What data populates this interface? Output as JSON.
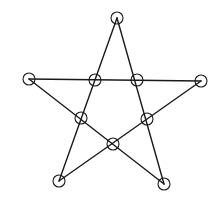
{
  "diagram": {
    "type": "pentagram-graph",
    "colors": {
      "stroke": "#1a1a1a",
      "background": "#ffffff"
    },
    "node_radius": 6,
    "nodes": [
      {
        "id": "outer-top",
        "x": 117,
        "y": 18
      },
      {
        "id": "outer-left",
        "x": 29,
        "y": 79
      },
      {
        "id": "outer-right",
        "x": 201,
        "y": 81
      },
      {
        "id": "outer-bottom-left",
        "x": 59,
        "y": 181
      },
      {
        "id": "outer-bottom-right",
        "x": 164,
        "y": 184
      },
      {
        "id": "inner-top-left",
        "x": 95,
        "y": 80
      },
      {
        "id": "inner-top-right",
        "x": 137,
        "y": 80
      },
      {
        "id": "inner-left",
        "x": 81,
        "y": 118
      },
      {
        "id": "inner-right",
        "x": 147,
        "y": 119
      },
      {
        "id": "inner-bottom",
        "x": 113,
        "y": 144
      }
    ],
    "edges": [
      {
        "from": "outer-top",
        "to": "outer-bottom-left"
      },
      {
        "from": "outer-top",
        "to": "outer-bottom-right"
      },
      {
        "from": "outer-left",
        "to": "outer-right"
      },
      {
        "from": "outer-left",
        "to": "outer-bottom-right"
      },
      {
        "from": "outer-right",
        "to": "outer-bottom-left"
      }
    ]
  }
}
